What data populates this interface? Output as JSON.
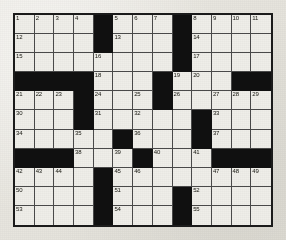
{
  "puzzle": {
    "title": "Crossword Puzzle Grid",
    "columns": 13,
    "rows": 11,
    "colors": {
      "paper": "#e9e9e4",
      "cell_fill": "#efeee9",
      "block_fill": "#101010",
      "grid_line": "#4a4a4a",
      "border": "#1b1b1b",
      "number_text": "#16160f"
    },
    "grid": [
      [
        {
          "block": false,
          "number": "1"
        },
        {
          "block": false,
          "number": "2"
        },
        {
          "block": false,
          "number": "3"
        },
        {
          "block": false,
          "number": "4"
        },
        {
          "block": true,
          "number": ""
        },
        {
          "block": false,
          "number": "5"
        },
        {
          "block": false,
          "number": "6"
        },
        {
          "block": false,
          "number": "7"
        },
        {
          "block": true,
          "number": ""
        },
        {
          "block": false,
          "number": "8"
        },
        {
          "block": false,
          "number": "9"
        },
        {
          "block": false,
          "number": "10"
        },
        {
          "block": false,
          "number": "11"
        }
      ],
      [
        {
          "block": false,
          "number": "12"
        },
        {
          "block": false,
          "number": ""
        },
        {
          "block": false,
          "number": ""
        },
        {
          "block": false,
          "number": ""
        },
        {
          "block": true,
          "number": ""
        },
        {
          "block": false,
          "number": "13"
        },
        {
          "block": false,
          "number": ""
        },
        {
          "block": false,
          "number": ""
        },
        {
          "block": true,
          "number": ""
        },
        {
          "block": false,
          "number": "14"
        },
        {
          "block": false,
          "number": ""
        },
        {
          "block": false,
          "number": ""
        },
        {
          "block": false,
          "number": ""
        }
      ],
      [
        {
          "block": false,
          "number": "15"
        },
        {
          "block": false,
          "number": ""
        },
        {
          "block": false,
          "number": ""
        },
        {
          "block": false,
          "number": ""
        },
        {
          "block": false,
          "number": "16"
        },
        {
          "block": false,
          "number": ""
        },
        {
          "block": false,
          "number": ""
        },
        {
          "block": false,
          "number": ""
        },
        {
          "block": true,
          "number": ""
        },
        {
          "block": false,
          "number": "17"
        },
        {
          "block": false,
          "number": ""
        },
        {
          "block": false,
          "number": ""
        },
        {
          "block": false,
          "number": ""
        }
      ],
      [
        {
          "block": true,
          "number": ""
        },
        {
          "block": true,
          "number": ""
        },
        {
          "block": true,
          "number": ""
        },
        {
          "block": true,
          "number": ""
        },
        {
          "block": false,
          "number": "18"
        },
        {
          "block": false,
          "number": ""
        },
        {
          "block": false,
          "number": ""
        },
        {
          "block": true,
          "number": ""
        },
        {
          "block": false,
          "number": "19"
        },
        {
          "block": false,
          "number": "20"
        },
        {
          "block": false,
          "number": ""
        },
        {
          "block": true,
          "number": ""
        },
        {
          "block": true,
          "number": ""
        }
      ],
      [
        {
          "block": false,
          "number": "21"
        },
        {
          "block": false,
          "number": "22"
        },
        {
          "block": false,
          "number": "23"
        },
        {
          "block": true,
          "number": ""
        },
        {
          "block": false,
          "number": "24"
        },
        {
          "block": false,
          "number": ""
        },
        {
          "block": false,
          "number": "25"
        },
        {
          "block": true,
          "number": ""
        },
        {
          "block": false,
          "number": "26"
        },
        {
          "block": false,
          "number": ""
        },
        {
          "block": false,
          "number": "27"
        },
        {
          "block": false,
          "number": "28"
        },
        {
          "block": false,
          "number": "29"
        }
      ],
      [
        {
          "block": false,
          "number": "30"
        },
        {
          "block": false,
          "number": ""
        },
        {
          "block": false,
          "number": ""
        },
        {
          "block": true,
          "number": ""
        },
        {
          "block": false,
          "number": "31"
        },
        {
          "block": false,
          "number": ""
        },
        {
          "block": false,
          "number": "32"
        },
        {
          "block": false,
          "number": ""
        },
        {
          "block": false,
          "number": ""
        },
        {
          "block": true,
          "number": ""
        },
        {
          "block": false,
          "number": "33"
        },
        {
          "block": false,
          "number": ""
        },
        {
          "block": false,
          "number": ""
        }
      ],
      [
        {
          "block": false,
          "number": "34"
        },
        {
          "block": false,
          "number": ""
        },
        {
          "block": false,
          "number": ""
        },
        {
          "block": false,
          "number": "35"
        },
        {
          "block": false,
          "number": ""
        },
        {
          "block": true,
          "number": ""
        },
        {
          "block": false,
          "number": "36"
        },
        {
          "block": false,
          "number": ""
        },
        {
          "block": false,
          "number": ""
        },
        {
          "block": true,
          "number": ""
        },
        {
          "block": false,
          "number": "37"
        },
        {
          "block": false,
          "number": ""
        },
        {
          "block": false,
          "number": ""
        }
      ],
      [
        {
          "block": true,
          "number": ""
        },
        {
          "block": true,
          "number": ""
        },
        {
          "block": true,
          "number": ""
        },
        {
          "block": false,
          "number": "38"
        },
        {
          "block": false,
          "number": ""
        },
        {
          "block": false,
          "number": "39"
        },
        {
          "block": true,
          "number": ""
        },
        {
          "block": false,
          "number": "40"
        },
        {
          "block": false,
          "number": ""
        },
        {
          "block": false,
          "number": "41"
        },
        {
          "block": true,
          "number": ""
        },
        {
          "block": true,
          "number": ""
        },
        {
          "block": true,
          "number": ""
        }
      ],
      [
        {
          "block": false,
          "number": "42"
        },
        {
          "block": false,
          "number": "43"
        },
        {
          "block": false,
          "number": "44"
        },
        {
          "block": false,
          "number": ""
        },
        {
          "block": true,
          "number": ""
        },
        {
          "block": false,
          "number": "45"
        },
        {
          "block": false,
          "number": "46"
        },
        {
          "block": false,
          "number": ""
        },
        {
          "block": false,
          "number": ""
        },
        {
          "block": false,
          "number": ""
        },
        {
          "block": false,
          "number": "47"
        },
        {
          "block": false,
          "number": "48"
        },
        {
          "block": false,
          "number": "49"
        }
      ],
      [
        {
          "block": false,
          "number": "50"
        },
        {
          "block": false,
          "number": ""
        },
        {
          "block": false,
          "number": ""
        },
        {
          "block": false,
          "number": ""
        },
        {
          "block": true,
          "number": ""
        },
        {
          "block": false,
          "number": "51"
        },
        {
          "block": false,
          "number": ""
        },
        {
          "block": false,
          "number": ""
        },
        {
          "block": true,
          "number": ""
        },
        {
          "block": false,
          "number": "52"
        },
        {
          "block": false,
          "number": ""
        },
        {
          "block": false,
          "number": ""
        },
        {
          "block": false,
          "number": ""
        }
      ],
      [
        {
          "block": false,
          "number": "53"
        },
        {
          "block": false,
          "number": ""
        },
        {
          "block": false,
          "number": ""
        },
        {
          "block": false,
          "number": ""
        },
        {
          "block": true,
          "number": ""
        },
        {
          "block": false,
          "number": "54"
        },
        {
          "block": false,
          "number": ""
        },
        {
          "block": false,
          "number": ""
        },
        {
          "block": true,
          "number": ""
        },
        {
          "block": false,
          "number": "55"
        },
        {
          "block": false,
          "number": ""
        },
        {
          "block": false,
          "number": ""
        },
        {
          "block": false,
          "number": ""
        }
      ]
    ]
  }
}
